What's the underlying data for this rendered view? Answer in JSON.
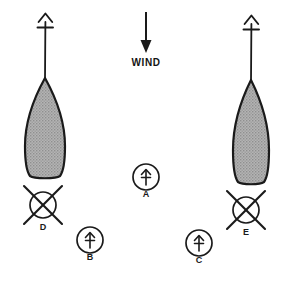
{
  "diagram": {
    "background_color": "#ffffff",
    "ink_color": "#1a1a1a",
    "hull_fill_color": "#a8a8a8",
    "hull_stroke_color": "#1a1a1a"
  },
  "wind": {
    "label": "WIND",
    "direction": "down",
    "arrow_icon": "arrow-down-icon",
    "arrow_x": 146,
    "arrow_top_y": 12,
    "arrow_bottom_y": 52,
    "label_x": 146,
    "label_y": 62
  },
  "boats": [
    {
      "id": "boat-left",
      "name": "left-boat",
      "hull_center_x": 45,
      "hull_top_y": 78,
      "hull_bottom_y": 177,
      "hull_half_width": 20,
      "mast_top_y": 14,
      "mast_base_y": 80,
      "masthead_icon": "wind-indicator-arrow-icon",
      "heading": "up"
    },
    {
      "id": "boat-right",
      "name": "right-boat",
      "hull_center_x": 251,
      "hull_top_y": 80,
      "hull_bottom_y": 183,
      "hull_half_width": 18,
      "mast_top_y": 16,
      "mast_base_y": 82,
      "masthead_icon": "wind-indicator-arrow-icon",
      "heading": "up"
    }
  ],
  "markers": [
    {
      "id": "marker-a",
      "label": "A",
      "type": "circle-with-arrow",
      "crossed_out": false,
      "cx": 146,
      "cy": 177,
      "r": 13,
      "label_x": 146,
      "label_y": 194,
      "icon": "boat-position-arrow-icon"
    },
    {
      "id": "marker-b",
      "label": "B",
      "type": "circle-with-arrow",
      "crossed_out": false,
      "cx": 90,
      "cy": 240,
      "r": 13,
      "label_x": 90,
      "label_y": 257,
      "icon": "boat-position-arrow-icon"
    },
    {
      "id": "marker-c",
      "label": "C",
      "type": "circle-with-arrow",
      "crossed_out": false,
      "cx": 199,
      "cy": 243,
      "r": 13,
      "label_x": 199,
      "label_y": 260,
      "icon": "boat-position-arrow-icon"
    },
    {
      "id": "marker-d",
      "label": "D",
      "type": "circle-crossed-out",
      "crossed_out": true,
      "cx": 43,
      "cy": 205,
      "r": 13,
      "cross_extent": 21,
      "label_x": 43,
      "label_y": 227,
      "icon": "invalid-position-cross-icon"
    },
    {
      "id": "marker-e",
      "label": "E",
      "type": "circle-crossed-out",
      "crossed_out": true,
      "cx": 246,
      "cy": 210,
      "r": 13,
      "cross_extent": 21,
      "label_x": 246,
      "label_y": 232,
      "icon": "invalid-position-cross-icon"
    }
  ]
}
